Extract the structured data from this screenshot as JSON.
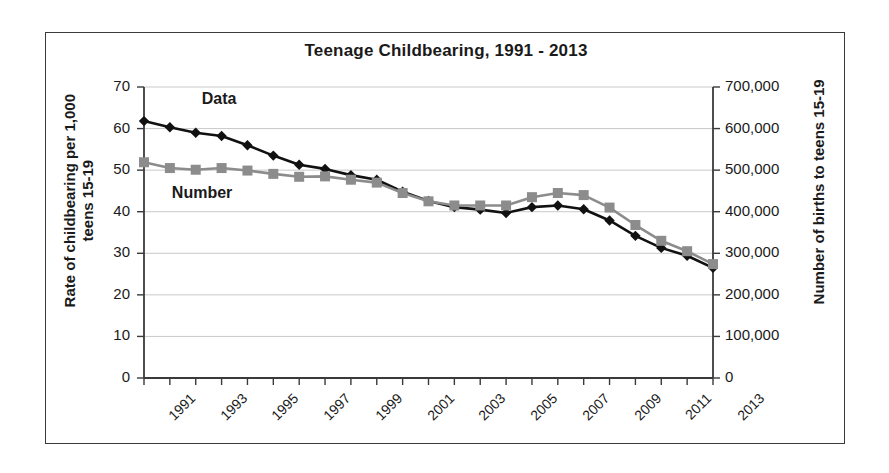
{
  "chart_data": {
    "type": "line",
    "title": "Teenage Childbearing, 1991 - 2013",
    "xlabel": "",
    "ylabel": "Rate of childbearing per 1,000 teens 15-19",
    "y2label": "Number of births to teens 15-19",
    "grid": true,
    "legend_position": "inline-annotation",
    "x": [
      1991,
      1992,
      1993,
      1994,
      1995,
      1996,
      1997,
      1998,
      1999,
      2000,
      2001,
      2002,
      2003,
      2004,
      2005,
      2006,
      2007,
      2008,
      2009,
      2010,
      2011,
      2012,
      2013
    ],
    "x_tick_labels": [
      "1991",
      "1993",
      "1995",
      "1997",
      "1999",
      "2001",
      "2003",
      "2005",
      "2007",
      "2009",
      "2011",
      "2013"
    ],
    "ylim": [
      0,
      70
    ],
    "y_tick_labels": [
      "0",
      "10",
      "20",
      "30",
      "40",
      "50",
      "60",
      "70"
    ],
    "y2lim": [
      0,
      700000
    ],
    "y2_tick_labels": [
      "0",
      "100,000",
      "200,000",
      "300,000",
      "400,000",
      "500,000",
      "600,000",
      "700,000"
    ],
    "series": [
      {
        "name": "Data",
        "annotation": "Data",
        "axis": "left",
        "marker": "diamond",
        "color": "#111111",
        "values": [
          61.8,
          60.3,
          59.0,
          58.2,
          56.0,
          53.5,
          51.3,
          50.3,
          48.8,
          47.7,
          44.8,
          42.6,
          41.1,
          40.5,
          39.7,
          41.1,
          41.5,
          40.6,
          37.9,
          34.2,
          31.3,
          29.4,
          26.5
        ]
      },
      {
        "name": "Number",
        "annotation": "Number",
        "axis": "right",
        "marker": "square",
        "color": "#8c8c8c",
        "values": [
          519000,
          505000,
          501000,
          505000,
          499000,
          491000,
          484000,
          485000,
          477000,
          470000,
          445000,
          425000,
          415000,
          415000,
          415000,
          435000,
          445000,
          440000,
          410000,
          368000,
          330000,
          305000,
          274000
        ]
      }
    ]
  },
  "annotations": {
    "data_label": "Data",
    "number_label": "Number"
  },
  "colors": {
    "rate_series": "#111111",
    "number_series": "#8c8c8c",
    "grid": "#c9c9c9",
    "axis": "#3a3a3a",
    "frame": "#3a3a3a",
    "background": "#ffffff"
  }
}
